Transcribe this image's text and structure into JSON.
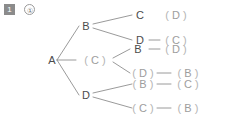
{
  "header": {
    "badge_number": "1",
    "badge_circle": "①"
  },
  "colors": {
    "badge_background": "#8b8b8b",
    "badge_text": "#ffffff",
    "node_text": "#4c4c4c",
    "dim_text": "#a7a7a7",
    "paren": "#b4b4b4",
    "edge": "#8f8f8f",
    "background": "#ffffff"
  },
  "diagram": {
    "root": {
      "label": "A",
      "paren": false
    },
    "level1": [
      {
        "label": "B",
        "paren": false
      },
      {
        "label": "C",
        "paren": true
      },
      {
        "label": "D",
        "paren": false
      }
    ],
    "level2": [
      {
        "label": "C",
        "paren": false
      },
      {
        "label": "D",
        "paren": false
      },
      {
        "label": "B",
        "paren": false
      },
      {
        "label": "D",
        "paren": true
      },
      {
        "label": "B",
        "paren": true
      },
      {
        "label": "C",
        "paren": true
      }
    ],
    "level3": [
      {
        "label": "D",
        "paren": true
      },
      {
        "label": "C",
        "paren": true
      },
      {
        "label": "D",
        "paren": true
      },
      {
        "label": "B",
        "paren": true
      },
      {
        "label": "C",
        "paren": true
      },
      {
        "label": "B",
        "paren": true
      }
    ],
    "rows": [
      {
        "branch": "B",
        "second": "C",
        "third": "( D )"
      },
      {
        "branch": "B",
        "second": "D",
        "third": "( C )"
      },
      {
        "branch": "( C )",
        "second": "B",
        "third": "( D )"
      },
      {
        "branch": "( C )",
        "second": "( D )",
        "third": "( B )"
      },
      {
        "branch": "D",
        "second": "( B )",
        "third": "( C )"
      },
      {
        "branch": "D",
        "second": "( C )",
        "third": "( B )"
      }
    ]
  }
}
